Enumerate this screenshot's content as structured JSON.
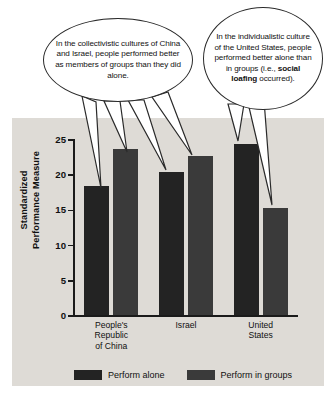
{
  "callouts": [
    {
      "name": "collectivistic-callout",
      "text": "In the collectivistic cultures of China and Israel, people performed better as members of groups than they did alone."
    },
    {
      "name": "individualistic-callout",
      "text_before": "In the individualistic culture of the United States, people performed better alone than in groups (i.e., ",
      "bold": "social loafing",
      "text_after": " occurred)."
    }
  ],
  "chart_data": {
    "type": "bar",
    "title": "",
    "xlabel": "",
    "ylabel": "Standardized Performance Measure",
    "ylabel_line1": "Standardized",
    "ylabel_line2": "Performance Measure",
    "ylim": [
      0,
      25
    ],
    "yticks": [
      0,
      5,
      10,
      15,
      20,
      25
    ],
    "ytick_labels": [
      "0",
      "5",
      "10",
      "15",
      "20",
      "25"
    ],
    "grid": false,
    "legend_position": "bottom",
    "categories": [
      "People's Republic of China",
      "Israel",
      "United States"
    ],
    "category_lines": [
      [
        "People's",
        "Republic",
        "of China"
      ],
      [
        "Israel"
      ],
      [
        "United",
        "States"
      ]
    ],
    "series": [
      {
        "name": "Perform alone",
        "color": "#232323",
        "values": [
          18.5,
          20.5,
          24.5
        ]
      },
      {
        "name": "Perform in groups",
        "color": "#3a3a3a",
        "values": [
          23.7,
          22.7,
          15.3
        ]
      }
    ]
  },
  "colors": {
    "panel_background": "#dedbd6",
    "page_background": "#ffffff",
    "axis": "#1a1a1a",
    "bar_alone": "#232323",
    "bar_groups": "#3a3a3a",
    "bubble_outline": "#2a2a2a",
    "text": "#101010"
  }
}
